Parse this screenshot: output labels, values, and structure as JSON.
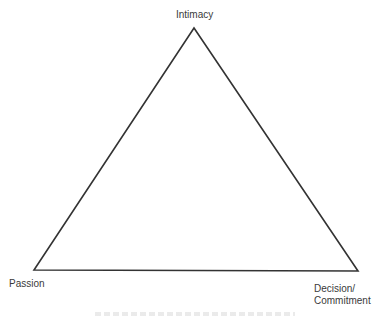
{
  "diagram": {
    "type": "triangle",
    "title_caption_cut_off": true,
    "vertices": {
      "top": {
        "label": "Intimacy"
      },
      "bottom_left": {
        "label": "Passion"
      },
      "bottom_right": {
        "label_line1": "Decision/",
        "label_line2": "Commitment"
      }
    },
    "stroke_color": "#333333",
    "background_color": "#ffffff"
  }
}
